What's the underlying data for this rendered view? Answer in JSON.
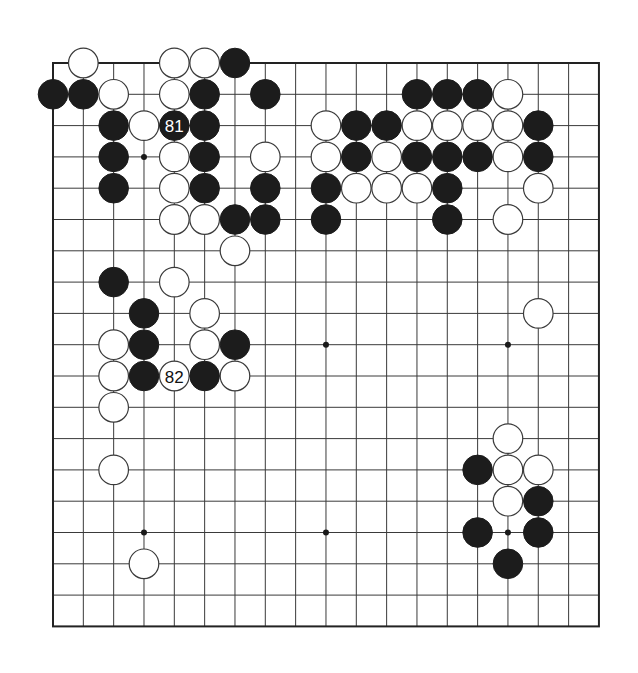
{
  "board": {
    "size": 19,
    "origin_x": 53,
    "origin_y": 63,
    "spacing_x": 30.33,
    "spacing_y": 31.3,
    "stone_radius": 14.8,
    "colors": {
      "black": "#1c1c1c",
      "white": "#ffffff",
      "line": "#3a3a3a"
    },
    "hoshi": [
      [
        3,
        3
      ],
      [
        9,
        3
      ],
      [
        15,
        3
      ],
      [
        3,
        9
      ],
      [
        9,
        9
      ],
      [
        15,
        9
      ],
      [
        3,
        15
      ],
      [
        9,
        15
      ],
      [
        15,
        15
      ]
    ],
    "stones": [
      {
        "c": 1,
        "r": 0,
        "color": "white"
      },
      {
        "c": 4,
        "r": 0,
        "color": "white"
      },
      {
        "c": 5,
        "r": 0,
        "color": "white"
      },
      {
        "c": 6,
        "r": 0,
        "color": "black"
      },
      {
        "c": 0,
        "r": 1,
        "color": "black"
      },
      {
        "c": 1,
        "r": 1,
        "color": "black"
      },
      {
        "c": 2,
        "r": 1,
        "color": "white"
      },
      {
        "c": 4,
        "r": 1,
        "color": "white"
      },
      {
        "c": 5,
        "r": 1,
        "color": "black"
      },
      {
        "c": 7,
        "r": 1,
        "color": "black"
      },
      {
        "c": 12,
        "r": 1,
        "color": "black"
      },
      {
        "c": 13,
        "r": 1,
        "color": "black"
      },
      {
        "c": 14,
        "r": 1,
        "color": "black"
      },
      {
        "c": 15,
        "r": 1,
        "color": "white"
      },
      {
        "c": 2,
        "r": 2,
        "color": "black"
      },
      {
        "c": 3,
        "r": 2,
        "color": "white"
      },
      {
        "c": 4,
        "r": 2,
        "color": "black",
        "label": "81"
      },
      {
        "c": 5,
        "r": 2,
        "color": "black"
      },
      {
        "c": 9,
        "r": 2,
        "color": "white"
      },
      {
        "c": 10,
        "r": 2,
        "color": "black"
      },
      {
        "c": 11,
        "r": 2,
        "color": "black"
      },
      {
        "c": 12,
        "r": 2,
        "color": "white"
      },
      {
        "c": 13,
        "r": 2,
        "color": "white"
      },
      {
        "c": 14,
        "r": 2,
        "color": "white"
      },
      {
        "c": 15,
        "r": 2,
        "color": "white"
      },
      {
        "c": 16,
        "r": 2,
        "color": "black"
      },
      {
        "c": 2,
        "r": 3,
        "color": "black"
      },
      {
        "c": 4,
        "r": 3,
        "color": "white"
      },
      {
        "c": 5,
        "r": 3,
        "color": "black"
      },
      {
        "c": 7,
        "r": 3,
        "color": "white"
      },
      {
        "c": 9,
        "r": 3,
        "color": "white"
      },
      {
        "c": 10,
        "r": 3,
        "color": "black"
      },
      {
        "c": 11,
        "r": 3,
        "color": "white"
      },
      {
        "c": 12,
        "r": 3,
        "color": "black"
      },
      {
        "c": 13,
        "r": 3,
        "color": "black"
      },
      {
        "c": 14,
        "r": 3,
        "color": "black"
      },
      {
        "c": 15,
        "r": 3,
        "color": "white"
      },
      {
        "c": 16,
        "r": 3,
        "color": "black"
      },
      {
        "c": 2,
        "r": 4,
        "color": "black"
      },
      {
        "c": 4,
        "r": 4,
        "color": "white"
      },
      {
        "c": 5,
        "r": 4,
        "color": "black"
      },
      {
        "c": 7,
        "r": 4,
        "color": "black"
      },
      {
        "c": 9,
        "r": 4,
        "color": "black"
      },
      {
        "c": 10,
        "r": 4,
        "color": "white"
      },
      {
        "c": 11,
        "r": 4,
        "color": "white"
      },
      {
        "c": 12,
        "r": 4,
        "color": "white"
      },
      {
        "c": 13,
        "r": 4,
        "color": "black"
      },
      {
        "c": 16,
        "r": 4,
        "color": "white"
      },
      {
        "c": 4,
        "r": 5,
        "color": "white"
      },
      {
        "c": 5,
        "r": 5,
        "color": "white"
      },
      {
        "c": 6,
        "r": 5,
        "color": "black"
      },
      {
        "c": 7,
        "r": 5,
        "color": "black"
      },
      {
        "c": 9,
        "r": 5,
        "color": "black"
      },
      {
        "c": 13,
        "r": 5,
        "color": "black"
      },
      {
        "c": 15,
        "r": 5,
        "color": "white"
      },
      {
        "c": 6,
        "r": 6,
        "color": "white"
      },
      {
        "c": 2,
        "r": 7,
        "color": "black"
      },
      {
        "c": 4,
        "r": 7,
        "color": "white"
      },
      {
        "c": 3,
        "r": 8,
        "color": "black"
      },
      {
        "c": 5,
        "r": 8,
        "color": "white"
      },
      {
        "c": 16,
        "r": 8,
        "color": "white"
      },
      {
        "c": 2,
        "r": 9,
        "color": "white"
      },
      {
        "c": 3,
        "r": 9,
        "color": "black"
      },
      {
        "c": 5,
        "r": 9,
        "color": "white"
      },
      {
        "c": 6,
        "r": 9,
        "color": "black"
      },
      {
        "c": 2,
        "r": 10,
        "color": "white"
      },
      {
        "c": 3,
        "r": 10,
        "color": "black"
      },
      {
        "c": 4,
        "r": 10,
        "color": "white",
        "label": "82"
      },
      {
        "c": 5,
        "r": 10,
        "color": "black"
      },
      {
        "c": 6,
        "r": 10,
        "color": "white"
      },
      {
        "c": 2,
        "r": 11,
        "color": "white"
      },
      {
        "c": 15,
        "r": 12,
        "color": "white"
      },
      {
        "c": 2,
        "r": 13,
        "color": "white"
      },
      {
        "c": 14,
        "r": 13,
        "color": "black"
      },
      {
        "c": 15,
        "r": 13,
        "color": "white"
      },
      {
        "c": 16,
        "r": 13,
        "color": "white"
      },
      {
        "c": 15,
        "r": 14,
        "color": "white"
      },
      {
        "c": 16,
        "r": 14,
        "color": "black"
      },
      {
        "c": 14,
        "r": 15,
        "color": "black"
      },
      {
        "c": 16,
        "r": 15,
        "color": "black"
      },
      {
        "c": 3,
        "r": 16,
        "color": "white"
      },
      {
        "c": 15,
        "r": 16,
        "color": "black"
      }
    ]
  }
}
